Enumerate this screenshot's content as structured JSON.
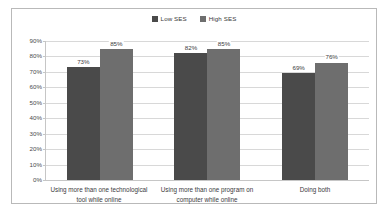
{
  "chart_data": {
    "type": "bar",
    "title": "",
    "xlabel": "",
    "ylabel": "",
    "ylim": [
      0,
      90
    ],
    "grid": true,
    "legend_position": "top-center",
    "categories": [
      "Using more than one technological tool while online",
      "Using more than one program on computer while online",
      "Doing both"
    ],
    "ytick_labels": [
      "90%",
      "80%",
      "70%",
      "60%",
      "50%",
      "40%",
      "30%",
      "20%",
      "10%",
      "0%"
    ],
    "ytick_values": [
      90,
      80,
      70,
      60,
      50,
      40,
      30,
      20,
      10,
      0
    ],
    "series": [
      {
        "name": "Low SES",
        "color": "#4a4a4a",
        "values": [
          73,
          82,
          69
        ],
        "value_labels": [
          "73%",
          "82%",
          "69%"
        ]
      },
      {
        "name": "High SES",
        "color": "#6e6e6e",
        "values": [
          85,
          85,
          76
        ],
        "value_labels": [
          "85%",
          "85%",
          "76%"
        ]
      }
    ]
  },
  "colors": {
    "low_ses": "#4a4a4a",
    "high_ses": "#6e6e6e",
    "gridline": "#d8d8d8",
    "axis": "#c6c6c6",
    "frame_border": "#b9b9b9",
    "text": "#3a3a3c",
    "background": "#ffffff"
  }
}
